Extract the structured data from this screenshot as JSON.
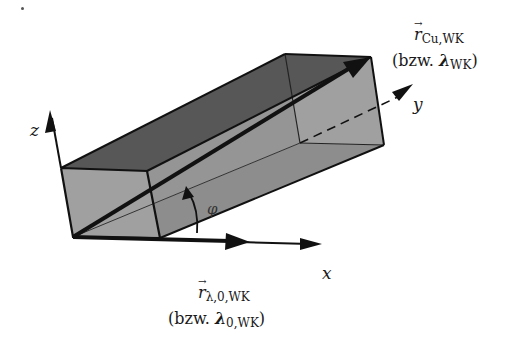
{
  "figure": {
    "type": "3d-box-with-vectors",
    "axes": {
      "x_label": "x",
      "y_label": "y",
      "z_label": "z"
    },
    "angle_label": "φ",
    "vector_top": {
      "symbol": "r",
      "subscript": "Cu,WK",
      "alt_prefix": "(bzw. ",
      "alt_symbol": "λ",
      "alt_subscript": "WK",
      "alt_suffix": ")"
    },
    "vector_bottom": {
      "symbol": "r",
      "subscript": "λ,0,WK",
      "alt_prefix": "(bzw. ",
      "alt_symbol": "λ",
      "alt_subscript": "0,WK",
      "alt_suffix": ")"
    },
    "colors": {
      "top_face": "#575757",
      "front_face": "#9c9c9c",
      "right_face": "#a3a3a3",
      "bottom_face": "#7d7d7d",
      "inner_face": "#8c8c8c",
      "stroke": "#111111"
    }
  }
}
